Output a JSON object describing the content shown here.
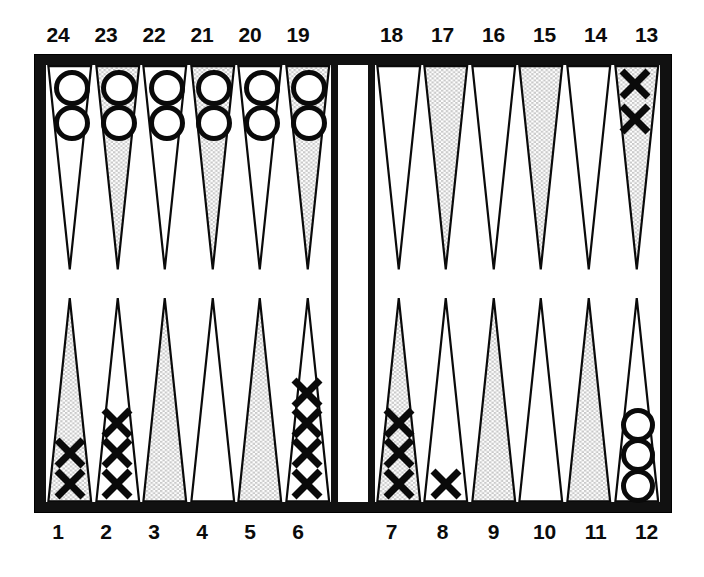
{
  "figure": {
    "name": "backgammon-board",
    "colors": {
      "frame": "#111111",
      "surface": "#ffffff",
      "shaded_point": "#c9c9c9",
      "white_point": "#ffffff",
      "point_outline": "#0a0a0a",
      "checker_ink": "#0a0a0a",
      "label_text": "#0b0b0b"
    }
  },
  "labels": {
    "top_left": [
      "24",
      "23",
      "22",
      "21",
      "20",
      "19"
    ],
    "top_right": [
      "18",
      "17",
      "16",
      "15",
      "14",
      "13"
    ],
    "bottom_left": [
      "1",
      "2",
      "3",
      "4",
      "5",
      "6"
    ],
    "bottom_right": [
      "7",
      "8",
      "9",
      "10",
      "11",
      "12"
    ]
  },
  "chart_data": {
    "type": "diagram",
    "notation": {
      "O": "open circle checker",
      "X": "cross checker"
    },
    "quadrants": {
      "top_left": {
        "label_order": [
          "24",
          "23",
          "22",
          "21",
          "20",
          "19"
        ],
        "points": [
          {
            "point": 24,
            "shaded": false,
            "checker": "O",
            "count": 2
          },
          {
            "point": 23,
            "shaded": true,
            "checker": "O",
            "count": 2
          },
          {
            "point": 22,
            "shaded": false,
            "checker": "O",
            "count": 2
          },
          {
            "point": 21,
            "shaded": true,
            "checker": "O",
            "count": 2
          },
          {
            "point": 20,
            "shaded": false,
            "checker": "O",
            "count": 2
          },
          {
            "point": 19,
            "shaded": true,
            "checker": "O",
            "count": 2
          }
        ]
      },
      "top_right": {
        "label_order": [
          "18",
          "17",
          "16",
          "15",
          "14",
          "13"
        ],
        "points": [
          {
            "point": 18,
            "shaded": false,
            "checker": null,
            "count": 0
          },
          {
            "point": 17,
            "shaded": true,
            "checker": null,
            "count": 0
          },
          {
            "point": 16,
            "shaded": false,
            "checker": null,
            "count": 0
          },
          {
            "point": 15,
            "shaded": true,
            "checker": null,
            "count": 0
          },
          {
            "point": 14,
            "shaded": false,
            "checker": null,
            "count": 0
          },
          {
            "point": 13,
            "shaded": true,
            "checker": "X",
            "count": 2
          }
        ]
      },
      "bottom_left": {
        "label_order": [
          "1",
          "2",
          "3",
          "4",
          "5",
          "6"
        ],
        "points": [
          {
            "point": 1,
            "shaded": true,
            "checker": "X",
            "count": 2
          },
          {
            "point": 2,
            "shaded": false,
            "checker": "X",
            "count": 3
          },
          {
            "point": 3,
            "shaded": true,
            "checker": null,
            "count": 0
          },
          {
            "point": 4,
            "shaded": false,
            "checker": null,
            "count": 0
          },
          {
            "point": 5,
            "shaded": true,
            "checker": null,
            "count": 0
          },
          {
            "point": 6,
            "shaded": false,
            "checker": "X",
            "count": 4
          }
        ]
      },
      "bottom_right": {
        "label_order": [
          "7",
          "8",
          "9",
          "10",
          "11",
          "12"
        ],
        "points": [
          {
            "point": 7,
            "shaded": true,
            "checker": "X",
            "count": 3
          },
          {
            "point": 8,
            "shaded": false,
            "checker": "X",
            "count": 1
          },
          {
            "point": 9,
            "shaded": true,
            "checker": null,
            "count": 0
          },
          {
            "point": 10,
            "shaded": false,
            "checker": null,
            "count": 0
          },
          {
            "point": 11,
            "shaded": true,
            "checker": null,
            "count": 0
          },
          {
            "point": 12,
            "shaded": false,
            "checker": "O",
            "count": 3
          }
        ]
      }
    },
    "totals": {
      "O": 15,
      "X": 15
    }
  }
}
